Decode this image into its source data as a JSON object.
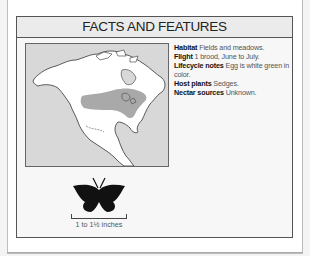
{
  "header": {
    "title": "FACTS AND FEATURES"
  },
  "facts": [
    {
      "label": "Habitat",
      "value": "Fields and meadows."
    },
    {
      "label": "Flight",
      "value": "1 brood, June to July."
    },
    {
      "label": "Lifecycle notes",
      "value": "Egg is white green in color."
    },
    {
      "label": "Host plants",
      "value": "Sedges."
    },
    {
      "label": "Nectar sources",
      "value": "Unknown."
    }
  ],
  "map": {
    "description": "North America range map",
    "range_color": "#a9a9a9",
    "land_color": "#ffffff",
    "water_color": "#d8d8d8"
  },
  "size": {
    "label": "1 to 1½ inches",
    "icon": "butterfly-silhouette-icon"
  }
}
